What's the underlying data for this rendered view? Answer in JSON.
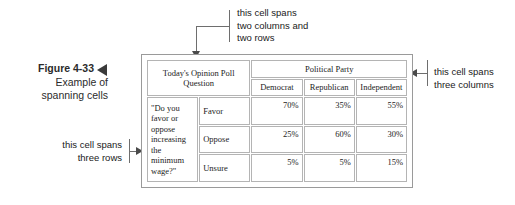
{
  "figure": {
    "number": "Figure 4-33",
    "caption_line1": "Example of",
    "caption_line2": "spanning cells",
    "pointer_icon": "left-triangle-icon"
  },
  "annotations": {
    "top": {
      "line1": "this cell spans",
      "line2": "two columns and",
      "line3": "two rows",
      "arrow_icon": "down-arrow-icon"
    },
    "left": {
      "line1": "this cell spans",
      "line2": "three rows",
      "arrow_icon": "right-arrow-icon"
    },
    "right": {
      "line1": "this cell spans",
      "line2": "three columns",
      "arrow_icon": "left-arrow-icon"
    }
  },
  "table": {
    "question_header": "Today's Opinion Poll Question",
    "party_header": "Political Party",
    "column_headers": [
      "Democrat",
      "Republican",
      "Independent"
    ],
    "question_text": "\"Do you favor or oppose increasing the minimum wage?\"",
    "rows": [
      {
        "label": "Favor",
        "values": [
          "70%",
          "35%",
          "55%"
        ]
      },
      {
        "label": "Oppose",
        "values": [
          "25%",
          "60%",
          "30%"
        ]
      },
      {
        "label": "Unsure",
        "values": [
          "5%",
          "5%",
          "15%"
        ]
      }
    ]
  }
}
